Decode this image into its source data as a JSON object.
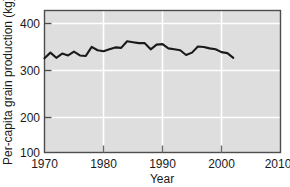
{
  "chart_data": {
    "type": "line",
    "title": "",
    "xlabel": "Year",
    "ylabel": "Per-capita grain production (kg)",
    "xlim": [
      1970,
      2010
    ],
    "ylim": [
      100,
      400
    ],
    "xticks": [
      1970,
      1980,
      1990,
      2000,
      2010
    ],
    "yticks": [
      100,
      200,
      300,
      400
    ],
    "grid": "white gridlines on gray plot background",
    "legend": "none",
    "series": [
      {
        "name": "Per-capita grain production",
        "color": "#1a1a1a",
        "x": [
          1970,
          1971,
          1972,
          1973,
          1974,
          1975,
          1976,
          1977,
          1978,
          1979,
          1980,
          1981,
          1982,
          1983,
          1984,
          1985,
          1986,
          1987,
          1988,
          1989,
          1990,
          1991,
          1992,
          1993,
          1994,
          1995,
          1996,
          1997,
          1998,
          1999,
          2000,
          2001,
          2002
        ],
        "values": [
          299,
          311,
          300,
          309,
          305,
          313,
          305,
          304,
          323,
          316,
          314,
          318,
          322,
          321,
          335,
          333,
          331,
          331,
          318,
          328,
          329,
          320,
          318,
          316,
          306,
          311,
          324,
          323,
          320,
          318,
          312,
          310,
          300
        ]
      }
    ]
  },
  "axes": {
    "y_tick_labels": [
      "400",
      "300",
      "200",
      "100"
    ],
    "x_tick_labels": [
      "1970",
      "1980",
      "1990",
      "2000",
      "2010"
    ],
    "x_axis_title": "Year",
    "y_axis_title": "Per-capita grain production (kg)"
  },
  "colors": {
    "plot_background": "#dedede",
    "gridline": "#ffffff",
    "frame": "#4d4d4d",
    "line": "#1a1a1a",
    "text": "#1a1a1a",
    "page_background": "#ffffff"
  }
}
